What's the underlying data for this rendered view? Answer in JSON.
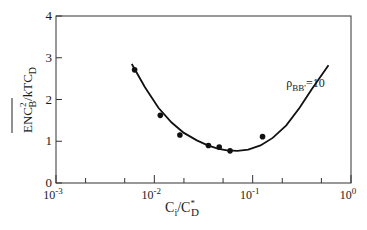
{
  "chart_data": {
    "type": "scatter",
    "title": "",
    "xlabel": "C_i/C*_D",
    "ylabel": "ENC²_B/kTC_D",
    "xscale": "log",
    "xlim": [
      0.001,
      1
    ],
    "ylim": [
      0,
      4
    ],
    "x_tick_labels": [
      {
        "base": "10",
        "exp": "-3",
        "value": 0.001
      },
      {
        "base": "10",
        "exp": "-2",
        "value": 0.01
      },
      {
        "base": "10",
        "exp": "-1",
        "value": 0.1
      },
      {
        "base": "10",
        "exp": "0",
        "value": 1
      }
    ],
    "x_minor_ticks": [
      0.002,
      0.005,
      0.02,
      0.05,
      0.2,
      0.5
    ],
    "y_ticks": [
      0,
      1,
      2,
      3,
      4
    ],
    "grid": false,
    "annotation": {
      "text_main": "ρ",
      "text_sub": "BB'",
      "text_tail": "=10",
      "x": 0.22,
      "y": 2.3
    },
    "series": [
      {
        "name": "measured",
        "kind": "scatter",
        "x": [
          0.0063,
          0.0115,
          0.0182,
          0.0355,
          0.0457,
          0.0589,
          0.126
        ],
        "y": [
          2.71,
          1.62,
          1.15,
          0.9,
          0.86,
          0.77,
          1.11
        ]
      },
      {
        "name": "ρBB'=10 theory",
        "kind": "line",
        "x": [
          0.0059,
          0.008,
          0.011,
          0.015,
          0.02,
          0.027,
          0.035,
          0.045,
          0.055,
          0.07,
          0.09,
          0.12,
          0.16,
          0.22,
          0.3,
          0.4,
          0.59
        ],
        "y": [
          2.85,
          2.3,
          1.8,
          1.45,
          1.2,
          1.02,
          0.9,
          0.82,
          0.78,
          0.77,
          0.8,
          0.9,
          1.08,
          1.38,
          1.8,
          2.25,
          2.82
        ]
      }
    ]
  },
  "labels": {
    "y_axis": {
      "main": "ENC",
      "sup": "2",
      "sub": "B",
      "tail": "/kTC",
      "tail_sub": "D"
    },
    "x_axis": {
      "main": "C",
      "sub": "i",
      "mid": "/C",
      "sup": "*",
      "sub2": "D"
    }
  }
}
